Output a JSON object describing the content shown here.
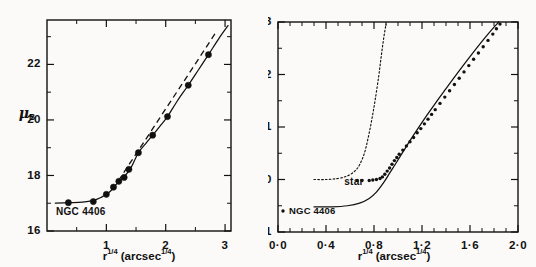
{
  "figure": {
    "name": "surface-brightness-profiles",
    "background_color": "#fbfaf8",
    "ink_color": "#111111"
  },
  "chart_data": [
    {
      "type": "line",
      "panel": "left",
      "title": "",
      "xlabel": "r^1/4 (arcsec^1/4)",
      "xlabel_parts": {
        "base": "r",
        "exp": "1/4",
        "unit_open": " (arcsec",
        "unit_exp": "1/4",
        "unit_close": ")"
      },
      "ylabel": "mu_B",
      "ylabel_parts": {
        "symbol": "μ",
        "subscript": "B"
      },
      "xlim": [
        0.0,
        3.1
      ],
      "ylim": [
        23.6,
        16.0
      ],
      "y_inverted": true,
      "grid": false,
      "xticks_major": [
        1,
        2,
        3
      ],
      "xticklabels_major": [
        "1",
        "2",
        "3"
      ],
      "xticks_minor": [
        0.5,
        1.5,
        2.5
      ],
      "yticks_major": [
        16,
        18,
        20,
        22
      ],
      "yticklabels_major": [
        "16",
        "18",
        "20",
        "22"
      ],
      "yticks_minor": [
        17,
        19,
        21,
        23
      ],
      "annotation": "NGC 4406",
      "series": [
        {
          "name": "observed-profile-points",
          "style": "filled-circle",
          "marker_size": 3.1,
          "x": [
            0.36,
            0.78,
            1.0,
            1.12,
            1.21,
            1.3,
            1.38,
            1.54,
            1.78,
            2.03,
            2.38,
            2.72
          ],
          "y": [
            17.02,
            17.06,
            17.32,
            17.58,
            17.79,
            17.93,
            18.22,
            18.82,
            19.45,
            20.12,
            21.25,
            22.35
          ]
        },
        {
          "name": "fitted-profile-curve",
          "style": "solid",
          "x": [
            0.14,
            0.36,
            0.6,
            0.78,
            0.92,
            1.0,
            1.08,
            1.16,
            1.24,
            1.32,
            1.42,
            1.54,
            1.66,
            1.78,
            1.92,
            2.03,
            2.2,
            2.38,
            2.55,
            2.72,
            2.9,
            3.05
          ],
          "y": [
            17.0,
            17.02,
            17.04,
            17.1,
            17.22,
            17.32,
            17.46,
            17.66,
            17.84,
            18.0,
            18.3,
            18.82,
            19.14,
            19.45,
            19.82,
            20.12,
            20.7,
            21.25,
            21.8,
            22.35,
            22.95,
            23.4
          ]
        },
        {
          "name": "r-quarter-law-dashed",
          "style": "dashed",
          "x": [
            1.2,
            1.4,
            1.7,
            2.0,
            2.3,
            2.6,
            2.86
          ],
          "y": [
            17.8,
            18.45,
            19.42,
            20.4,
            21.37,
            22.35,
            23.2
          ]
        }
      ]
    },
    {
      "type": "scatter",
      "panel": "right",
      "title": "",
      "xlabel": "r^1/4 (arcsec^1/4)",
      "xlabel_parts": {
        "base": "r",
        "exp": "1/4",
        "unit_open": " (arcsec",
        "unit_exp": "1/4",
        "unit_close": ")"
      },
      "ylabel": "mu_V",
      "ylabel_parts": {
        "symbol": "μ",
        "subscript": "V"
      },
      "xlim": [
        0.0,
        2.0
      ],
      "ylim": [
        3.0,
        -1.0
      ],
      "y_inverted": true,
      "grid": false,
      "xticks_major": [
        0.0,
        0.4,
        0.8,
        1.2,
        1.6,
        2.0
      ],
      "xticklabels_major": [
        "0·0",
        "0·4",
        "0·8",
        "1·2",
        "1·6",
        "2·0"
      ],
      "xticks_minor": [
        0.1,
        0.2,
        0.3,
        0.5,
        0.6,
        0.7,
        0.9,
        1.0,
        1.1,
        1.3,
        1.4,
        1.5,
        1.7,
        1.8,
        1.9
      ],
      "yticks_major": [
        -1,
        0,
        1,
        2,
        3
      ],
      "yticklabels_major": [
        "-1",
        "0",
        "1",
        "2",
        "3"
      ],
      "yticks_minor": [
        -0.5,
        0.5,
        1.5,
        2.5
      ],
      "annotations": [
        {
          "name": "star-label",
          "text": "star"
        },
        {
          "name": "ngc-legend",
          "text": "NGC 4406",
          "marker": "dot"
        }
      ],
      "series": [
        {
          "name": "model-profile-curve",
          "style": "solid",
          "x": [
            0.3,
            0.45,
            0.58,
            0.68,
            0.76,
            0.82,
            0.88,
            0.93,
            0.98,
            1.04,
            1.1,
            1.16,
            1.24,
            1.32,
            1.4,
            1.5,
            1.6,
            1.7,
            1.78,
            1.84
          ],
          "y": [
            -0.52,
            -0.52,
            -0.5,
            -0.45,
            -0.36,
            -0.24,
            -0.06,
            0.12,
            0.3,
            0.52,
            0.74,
            0.95,
            1.22,
            1.48,
            1.73,
            2.04,
            2.34,
            2.63,
            2.85,
            3.0
          ]
        },
        {
          "name": "star-psf-dotted",
          "style": "dotted",
          "x": [
            0.3,
            0.4,
            0.5,
            0.58,
            0.64,
            0.68,
            0.72,
            0.75,
            0.78,
            0.81,
            0.84,
            0.86,
            0.88,
            0.9
          ],
          "y": [
            0.0,
            0.0,
            0.02,
            0.07,
            0.16,
            0.28,
            0.5,
            0.78,
            1.12,
            1.52,
            1.98,
            2.34,
            2.68,
            2.96
          ]
        },
        {
          "name": "observed-data-points",
          "style": "small-dot",
          "marker_size": 1.7,
          "x": [
            0.66,
            0.7,
            0.76,
            0.79,
            0.82,
            0.85,
            0.87,
            0.89,
            0.91,
            0.93,
            0.95,
            0.97,
            0.99,
            1.01,
            1.04,
            1.07,
            1.1,
            1.13,
            1.16,
            1.19,
            1.22,
            1.25,
            1.28,
            1.31,
            1.35,
            1.39,
            1.43,
            1.47,
            1.51,
            1.55,
            1.59,
            1.63,
            1.67,
            1.71,
            1.75,
            1.79,
            1.82,
            1.85
          ],
          "y": [
            -0.02,
            -0.02,
            -0.02,
            -0.01,
            0.0,
            0.02,
            0.05,
            0.1,
            0.16,
            0.22,
            0.29,
            0.36,
            0.42,
            0.48,
            0.56,
            0.64,
            0.72,
            0.8,
            0.89,
            0.97,
            1.06,
            1.15,
            1.24,
            1.33,
            1.45,
            1.57,
            1.69,
            1.81,
            1.93,
            2.05,
            2.17,
            2.29,
            2.41,
            2.53,
            2.65,
            2.77,
            2.87,
            2.96
          ]
        }
      ]
    }
  ]
}
